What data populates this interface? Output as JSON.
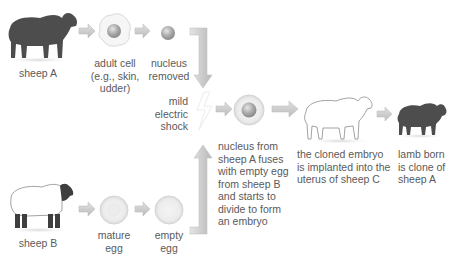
{
  "diagram": {
    "colors": {
      "arrow_fill": "#cfcfcf",
      "arrow_stroke": "#b5b5b5",
      "dark_sheep": "#4d4d4d",
      "cell_fill": "#f2f2f2",
      "nucleus": "#a9a9a9",
      "text": "#5a5a5a"
    },
    "nodes": {
      "sheep_a": {
        "label": "sheep A",
        "icon": "black-sheep-icon"
      },
      "adult_cell": {
        "label_lines": [
          "adult cell",
          "(e.g., skin,",
          "udder)"
        ],
        "icon": "cell-with-nucleus-icon"
      },
      "nucleus_removed": {
        "label_lines": [
          "nucleus",
          "removed"
        ],
        "icon": "nucleus-icon"
      },
      "shock": {
        "label_lines": [
          "mild",
          "electric",
          "shock"
        ],
        "icon": "lightning-icon"
      },
      "fused_cell": {
        "label_lines": [
          "nucleus from",
          "sheep A fuses",
          "with empty egg",
          "from sheep B",
          "and starts to",
          "divide to form",
          "an embryo"
        ],
        "icon": "fused-egg-icon"
      },
      "sheep_c": {
        "label_lines": [
          "the cloned embryo",
          "is implanted into the",
          "uterus of sheep C"
        ],
        "icon": "white-sheep-icon"
      },
      "lamb": {
        "label_lines": [
          "lamb born",
          "is clone of",
          "sheep A"
        ],
        "icon": "black-lamb-icon"
      },
      "sheep_b": {
        "label": "sheep B",
        "icon": "white-faced-black-sheep-icon"
      },
      "mature_egg": {
        "label_lines": [
          "mature",
          "egg"
        ],
        "icon": "egg-icon"
      },
      "empty_egg": {
        "label_lines": [
          "empty",
          "egg"
        ],
        "icon": "empty-egg-icon"
      }
    }
  }
}
